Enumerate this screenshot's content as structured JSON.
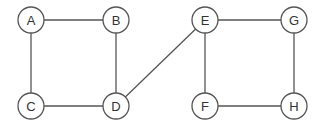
{
  "diagram": {
    "type": "undirected-graph",
    "nodes": [
      {
        "id": "A",
        "label": "A",
        "x": 31,
        "y": 20
      },
      {
        "id": "B",
        "label": "B",
        "x": 116,
        "y": 20
      },
      {
        "id": "C",
        "label": "C",
        "x": 31,
        "y": 106
      },
      {
        "id": "D",
        "label": "D",
        "x": 116,
        "y": 106
      },
      {
        "id": "E",
        "label": "E",
        "x": 205,
        "y": 20
      },
      {
        "id": "G",
        "label": "G",
        "x": 294,
        "y": 20
      },
      {
        "id": "F",
        "label": "F",
        "x": 205,
        "y": 106
      },
      {
        "id": "H",
        "label": "H",
        "x": 294,
        "y": 106
      }
    ],
    "edges": [
      [
        "A",
        "B"
      ],
      [
        "A",
        "C"
      ],
      [
        "B",
        "D"
      ],
      [
        "C",
        "D"
      ],
      [
        "D",
        "E"
      ],
      [
        "E",
        "G"
      ],
      [
        "E",
        "F"
      ],
      [
        "G",
        "H"
      ],
      [
        "F",
        "H"
      ]
    ],
    "node_radius": 13
  }
}
